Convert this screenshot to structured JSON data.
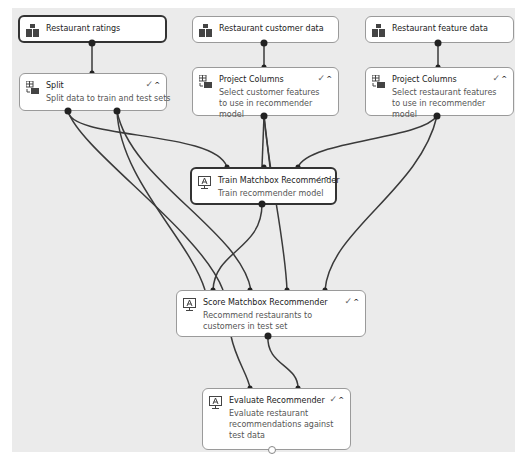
{
  "diagram": {
    "nodes": [
      {
        "id": "restaurant-ratings",
        "title": "Restaurant ratings",
        "description": "",
        "icon": "dataset-icon",
        "selected": true
      },
      {
        "id": "restaurant-customer-data",
        "title": "Restaurant customer data",
        "description": "",
        "icon": "dataset-icon"
      },
      {
        "id": "restaurant-feature-data",
        "title": "Restaurant feature data",
        "description": "",
        "icon": "dataset-icon"
      },
      {
        "id": "split",
        "title": "Split",
        "description": "Split data to train and test sets",
        "icon": "table-transform-icon",
        "status": "✓",
        "collapse": "^"
      },
      {
        "id": "project-columns-customer",
        "title": "Project Columns",
        "description": "Select customer features to use in recommender model",
        "icon": "table-transform-icon",
        "status": "✓",
        "collapse": "^"
      },
      {
        "id": "project-columns-restaurant",
        "title": "Project Columns",
        "description": "Select restaurant features to use in recommender model",
        "icon": "table-transform-icon",
        "status": "✓",
        "collapse": "^"
      },
      {
        "id": "train-matchbox",
        "title": "Train Matchbox Recommender",
        "description": "Train recommender model",
        "icon": "model-monitor-icon",
        "status": "✓",
        "collapse": "^",
        "selected": true
      },
      {
        "id": "score-matchbox",
        "title": "Score Matchbox Recommender",
        "description": "Recommend restaurants to customers in test set",
        "icon": "model-monitor-icon",
        "status": "✓",
        "collapse": "^"
      },
      {
        "id": "evaluate",
        "title": "Evaluate Recommender",
        "description": "Evaluate restaurant recommendations against test data",
        "icon": "model-monitor-icon",
        "status": "✓",
        "collapse": "^"
      }
    ],
    "edges": [
      {
        "from": "restaurant-ratings",
        "to": "split"
      },
      {
        "from": "restaurant-customer-data",
        "to": "project-columns-customer"
      },
      {
        "from": "restaurant-feature-data",
        "to": "project-columns-restaurant"
      },
      {
        "from": "split",
        "to": "train-matchbox"
      },
      {
        "from": "split",
        "to": "score-matchbox"
      },
      {
        "from": "split",
        "to": "score-matchbox"
      },
      {
        "from": "split",
        "to": "evaluate"
      },
      {
        "from": "project-columns-customer",
        "to": "train-matchbox"
      },
      {
        "from": "project-columns-customer",
        "to": "score-matchbox"
      },
      {
        "from": "project-columns-restaurant",
        "to": "train-matchbox"
      },
      {
        "from": "project-columns-restaurant",
        "to": "score-matchbox"
      },
      {
        "from": "train-matchbox",
        "to": "score-matchbox"
      },
      {
        "from": "score-matchbox",
        "to": "evaluate"
      }
    ],
    "colors": {
      "canvas": "#ebebeb",
      "node_fill": "#ffffff",
      "node_border": "#9a9a9a",
      "selected_border": "#333333",
      "edge": "#333333"
    }
  }
}
